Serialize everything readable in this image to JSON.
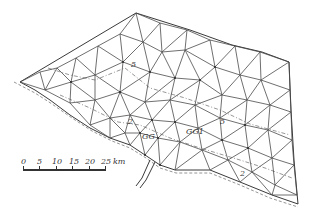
{
  "diagram": {
    "type": "triangular-finite-element-mesh",
    "labels": {
      "contour_5_top": "5",
      "contour_5_right": "5",
      "contour_2_mid": "2",
      "contour_2_bottom": "2",
      "gauge_1": "GG1",
      "gauge_2": "GG"
    },
    "scale_bar": {
      "ticks": [
        "0",
        "5",
        "10",
        "15",
        "20",
        "25"
      ],
      "unit": "km"
    },
    "colors": {
      "line": "#4a4a4a",
      "background": "#ffffff"
    }
  }
}
